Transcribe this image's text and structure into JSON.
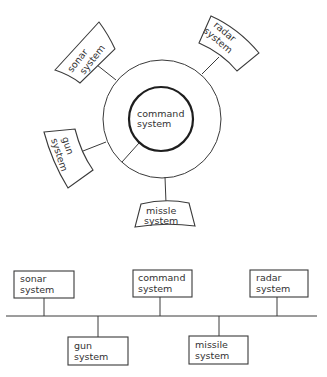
{
  "diagram": {
    "star": {
      "center": {
        "label_line1": "command",
        "label_line2": "system"
      },
      "nodes": [
        {
          "id": "sonar",
          "line1": "sonar",
          "line2": "system"
        },
        {
          "id": "radar",
          "line1": "radar",
          "line2": "system"
        },
        {
          "id": "gun",
          "line1": "gun",
          "line2": "system"
        },
        {
          "id": "missile",
          "line1": "missle",
          "line2": "system"
        }
      ]
    },
    "bus": {
      "top_nodes": [
        {
          "id": "sonar",
          "line1": "sonar",
          "line2": "system"
        },
        {
          "id": "command",
          "line1": "command",
          "line2": "system"
        },
        {
          "id": "radar",
          "line1": "radar",
          "line2": "system"
        }
      ],
      "bottom_nodes": [
        {
          "id": "gun",
          "line1": "gun",
          "line2": "system"
        },
        {
          "id": "missile",
          "line1": "missile",
          "line2": "system"
        }
      ]
    }
  }
}
